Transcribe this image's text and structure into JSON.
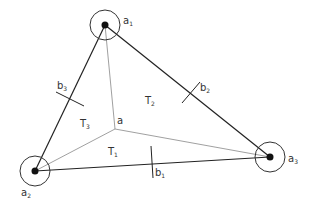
{
  "diagram": {
    "colors": {
      "stroke": "#222222",
      "thin": "#888888",
      "text": "#333333",
      "background": "#ffffff"
    },
    "vertices": [
      {
        "id": "a1",
        "label": "a",
        "sub": "1",
        "x": 105,
        "y": 25,
        "r": 15
      },
      {
        "id": "a2",
        "label": "a",
        "sub": "2",
        "x": 35,
        "y": 171,
        "r": 15
      },
      {
        "id": "a3",
        "label": "a",
        "sub": "3",
        "x": 270,
        "y": 157,
        "r": 15
      }
    ],
    "center": {
      "id": "a",
      "label": "a",
      "x": 115,
      "y": 129
    },
    "edges": [
      {
        "id": "b1",
        "label": "b",
        "sub": "1",
        "from": "a2",
        "to": "a3"
      },
      {
        "id": "b2",
        "label": "b",
        "sub": "2",
        "from": "a1",
        "to": "a3"
      },
      {
        "id": "b3",
        "label": "b",
        "sub": "3",
        "from": "a1",
        "to": "a2"
      }
    ],
    "regions": [
      {
        "id": "T1",
        "label": "T",
        "sub": "1"
      },
      {
        "id": "T2",
        "label": "T",
        "sub": "2"
      },
      {
        "id": "T3",
        "label": "T",
        "sub": "3"
      }
    ]
  }
}
